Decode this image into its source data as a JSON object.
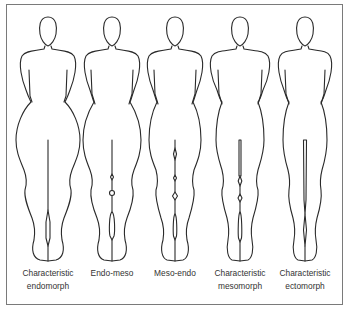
{
  "figure": {
    "stroke_color": "#2a2a2a",
    "frame_color": "#7a7a7a",
    "figures": [
      {
        "id": "endomorph",
        "label_line1": "Characteristic",
        "label_line2": "endomorph",
        "center_x": 48
      },
      {
        "id": "endo-meso",
        "label_line1": "Endo-meso",
        "label_line2": "",
        "center_x": 112
      },
      {
        "id": "meso-endo",
        "label_line1": "Meso-endo",
        "label_line2": "",
        "center_x": 175
      },
      {
        "id": "mesomorph",
        "label_line1": "Characteristic",
        "label_line2": "mesomorph",
        "center_x": 240
      },
      {
        "id": "ectomorph",
        "label_line1": "Characteristic",
        "label_line2": "ectomorph",
        "center_x": 305
      }
    ]
  }
}
